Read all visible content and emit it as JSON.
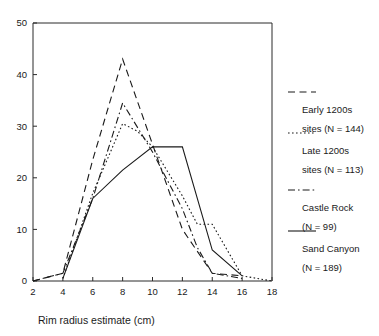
{
  "chart_data": {
    "type": "line",
    "title": "",
    "subtitle": "",
    "xlabel": "Rim radius estimate (cm)",
    "ylabel": "",
    "xlim": [
      2,
      18
    ],
    "ylim": [
      0,
      50
    ],
    "xticks": [
      2,
      4,
      6,
      8,
      10,
      12,
      14,
      16,
      18
    ],
    "yticks": [
      0,
      10,
      20,
      30,
      40,
      50
    ],
    "xtick_labels": [
      "2",
      "4",
      "6",
      "8",
      "10",
      "12",
      "14",
      "16",
      "18"
    ],
    "ytick_labels": [
      "0",
      "10",
      "20",
      "30",
      "40",
      "50"
    ],
    "grid": false,
    "legend_position": "right",
    "series": [
      {
        "name": "Early 1200s sites (N = 144)",
        "label_line1": "Early 1200s",
        "label_line2": "sites (N = 144)",
        "dash": "long-dash",
        "color": "#1a1a1a",
        "x": [
          2,
          4,
          6,
          8,
          10,
          12,
          14,
          16
        ],
        "y": [
          0,
          1.5,
          23.5,
          43,
          26.5,
          10,
          1.5,
          1
        ]
      },
      {
        "name": "Late 1200s sites (N = 113)",
        "label_line1": "Late 1200s",
        "label_line2": "sites (N = 113)",
        "dash": "dotted",
        "color": "#1a1a1a",
        "x": [
          4,
          6,
          8,
          9,
          10,
          12,
          13,
          14,
          16,
          18
        ],
        "y": [
          0.5,
          17,
          30.5,
          29,
          26,
          16.5,
          11,
          11,
          1,
          0
        ]
      },
      {
        "name": "Castle Rock (N = 99)",
        "label_line1": "Castle Rock",
        "label_line2": "(N = 99)",
        "dash": "dash-dot",
        "color": "#1a1a1a",
        "x": [
          2,
          4,
          6,
          8,
          10,
          12,
          13,
          14,
          16
        ],
        "y": [
          0,
          1.5,
          16,
          34.5,
          25,
          14,
          6.5,
          1.5,
          0.5
        ]
      },
      {
        "name": "Sand Canyon (N = 189)",
        "label_line1": "Sand Canyon",
        "label_line2": "(N = 189)",
        "dash": "solid",
        "color": "#1a1a1a",
        "x": [
          4,
          6,
          8,
          10,
          12,
          14,
          16
        ],
        "y": [
          0.5,
          16,
          21.5,
          26,
          26,
          6,
          1
        ]
      }
    ]
  },
  "axis": {
    "x_title": "Rim radius estimate (cm)"
  },
  "legend": {
    "entries": [
      {
        "line1": "Early 1200s",
        "line2": "sites (N = 144)"
      },
      {
        "line1": "Late 1200s",
        "line2": "sites (N = 113)"
      },
      {
        "line1": "Castle Rock",
        "line2": "(N = 99)"
      },
      {
        "line1": "Sand Canyon",
        "line2": "(N = 189)"
      }
    ]
  }
}
